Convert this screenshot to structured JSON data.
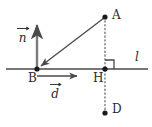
{
  "figure": {
    "background_color": "#ffffff",
    "stroke_color": "#4a4a4a",
    "text_color": "#2b2b2b",
    "width": 152,
    "height": 127,
    "points": [
      {
        "name": "A",
        "label": "A",
        "x": 105,
        "y": 17,
        "label_x": 112,
        "label_y": 10
      },
      {
        "name": "B",
        "label": "B",
        "x": 37,
        "y": 69,
        "label_x": 29,
        "label_y": 73
      },
      {
        "name": "H",
        "label": "H",
        "x": 105,
        "y": 69,
        "label_x": 94,
        "label_y": 73
      },
      {
        "name": "D",
        "label": "D",
        "x": 105,
        "y": 113,
        "label_x": 112,
        "label_y": 104
      }
    ],
    "line_label": {
      "name": "l",
      "label": "l",
      "x": 136,
      "y": 52
    },
    "vectors": [
      {
        "name": "n",
        "label": "n",
        "from_x": 37,
        "from_y": 69,
        "to_x": 37,
        "to_y": 22,
        "label_x": 18,
        "label_y": 28
      },
      {
        "name": "d",
        "label": "d",
        "from_x": 37,
        "from_y": 76,
        "to_x": 81,
        "to_y": 76,
        "label_x": 51,
        "label_y": 84
      }
    ],
    "segments": [
      {
        "name": "line-l",
        "style": "solid",
        "x1": 6,
        "y1": 69,
        "x2": 148,
        "y2": 69
      },
      {
        "name": "segment-A-to-B",
        "style": "solid-arrow",
        "x1": 105,
        "y1": 17,
        "x2": 39,
        "y2": 67
      },
      {
        "name": "segment-A-H-D",
        "style": "dotted",
        "x1": 105,
        "y1": 17,
        "x2": 105,
        "y2": 113
      }
    ],
    "right_angle": {
      "name": "right-angle-at-H",
      "x": 105,
      "y": 69,
      "size": 9
    }
  }
}
